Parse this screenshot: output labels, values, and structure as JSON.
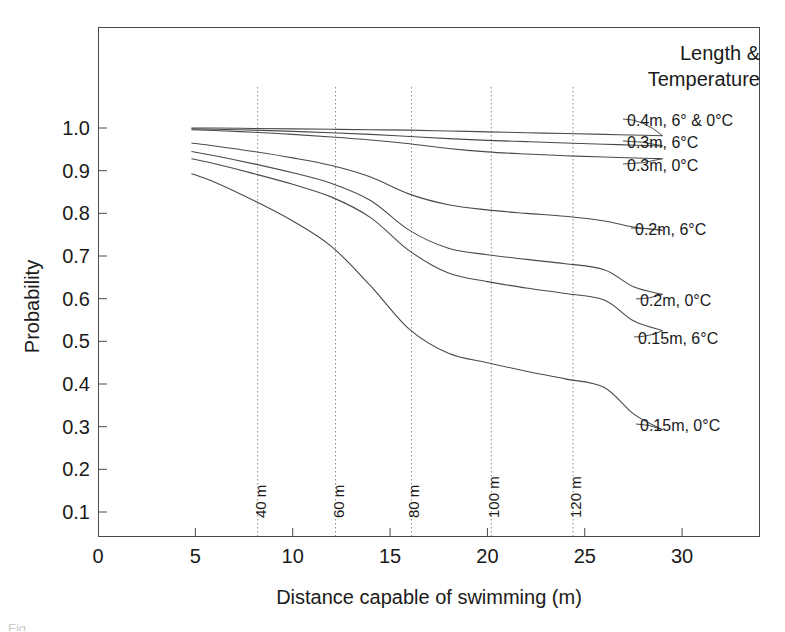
{
  "chart_data": {
    "type": "line",
    "title": "",
    "xlabel": "Distance capable of swimming (m)",
    "ylabel": "Probability",
    "xlim": [
      0,
      34
    ],
    "ylim": [
      0.0,
      1.05
    ],
    "grid": false,
    "legend_position": "right-inline-labels",
    "legend_title_line1": "Length &",
    "legend_title_line2": "Temperature",
    "xticks": [
      "0",
      "5",
      "10",
      "15",
      "20",
      "25",
      "30"
    ],
    "xtick_values": [
      0,
      5,
      10,
      15,
      20,
      25,
      30
    ],
    "yticks": [
      "1.0",
      "0.9",
      "0.8",
      "0.7",
      "0.6",
      "0.5",
      "0.4",
      "0.3",
      "0.2",
      "0.1"
    ],
    "ytick_values": [
      1.0,
      0.9,
      0.8,
      0.7,
      0.6,
      0.5,
      0.4,
      0.3,
      0.2,
      0.1
    ],
    "vertical_markers": [
      {
        "label": "40 m",
        "x": 8.2
      },
      {
        "label": "60 m",
        "x": 12.2
      },
      {
        "label": "80 m",
        "x": 16.1
      },
      {
        "label": "100 m",
        "x": 20.2
      },
      {
        "label": "120 m",
        "x": 24.4
      }
    ],
    "series": [
      {
        "name": "0.4m, 6° & 0°C",
        "label": "0.4m, 6° & 0°C",
        "x": [
          4.8,
          6,
          8,
          10,
          12,
          14,
          16,
          18,
          20,
          22,
          24,
          26,
          28,
          29
        ],
        "y": [
          1.0,
          1.0,
          0.999,
          0.998,
          0.997,
          0.996,
          0.995,
          0.993,
          0.991,
          0.989,
          0.987,
          0.985,
          0.983,
          0.982
        ]
      },
      {
        "name": "0.3m, 6°C",
        "label": "0.3m, 6°C",
        "x": [
          4.8,
          6,
          8,
          10,
          12,
          14,
          16,
          18,
          20,
          22,
          24,
          26,
          28,
          29
        ],
        "y": [
          0.998,
          0.997,
          0.995,
          0.992,
          0.989,
          0.985,
          0.98,
          0.975,
          0.971,
          0.968,
          0.965,
          0.962,
          0.959,
          0.958
        ]
      },
      {
        "name": "0.3m, 0°C",
        "label": "0.3m, 0°C",
        "x": [
          4.8,
          6,
          8,
          10,
          12,
          14,
          16,
          18,
          20,
          22,
          24,
          26,
          28,
          29
        ],
        "y": [
          0.996,
          0.994,
          0.99,
          0.985,
          0.979,
          0.972,
          0.963,
          0.952,
          0.944,
          0.939,
          0.935,
          0.932,
          0.929,
          0.928
        ]
      },
      {
        "name": "0.2m, 6°C",
        "label": "0.2m, 6°C",
        "x": [
          4.8,
          6,
          8,
          10,
          12,
          14,
          16,
          18,
          20,
          22,
          24,
          26,
          27.5,
          29
        ],
        "y": [
          0.965,
          0.958,
          0.945,
          0.93,
          0.912,
          0.885,
          0.845,
          0.82,
          0.808,
          0.8,
          0.793,
          0.782,
          0.768,
          0.76
        ]
      },
      {
        "name": "0.2m, 0°C",
        "label": "0.2m, 0°C",
        "x": [
          4.8,
          6,
          8,
          10,
          12,
          14,
          16,
          18,
          20,
          22,
          24,
          26,
          27.5,
          29
        ],
        "y": [
          0.945,
          0.935,
          0.916,
          0.895,
          0.87,
          0.83,
          0.76,
          0.718,
          0.703,
          0.692,
          0.682,
          0.668,
          0.628,
          0.61
        ]
      },
      {
        "name": "0.15m, 6°C",
        "label": "0.15m, 6°C",
        "x": [
          4.8,
          6,
          8,
          10,
          12,
          14,
          16,
          18,
          20,
          22,
          24,
          26,
          27.5,
          29
        ],
        "y": [
          0.928,
          0.916,
          0.893,
          0.868,
          0.838,
          0.79,
          0.712,
          0.66,
          0.64,
          0.625,
          0.612,
          0.597,
          0.548,
          0.525
        ]
      },
      {
        "name": "0.15m, 0°C",
        "label": "0.15m, 0°C",
        "x": [
          4.8,
          6,
          8,
          10,
          12,
          14,
          16,
          18,
          20,
          22,
          24,
          26,
          27.5,
          29
        ],
        "y": [
          0.893,
          0.873,
          0.83,
          0.782,
          0.722,
          0.63,
          0.528,
          0.472,
          0.45,
          0.43,
          0.412,
          0.392,
          0.33,
          0.293
        ]
      }
    ],
    "series_label_positions": [
      {
        "label": "0.4m, 6° & 0°C",
        "px": 627,
        "py": 113
      },
      {
        "label": "0.3m, 6°C",
        "px": 627,
        "py": 135
      },
      {
        "label": "0.3m, 0°C",
        "px": 627,
        "py": 158
      },
      {
        "label": "0.2m, 6°C",
        "px": 635,
        "py": 222
      },
      {
        "label": "0.2m, 0°C",
        "px": 640,
        "py": 293
      },
      {
        "label": "0.15m, 6°C",
        "px": 638,
        "py": 331
      },
      {
        "label": "0.15m, 0°C",
        "px": 640,
        "py": 418
      }
    ],
    "colors": {
      "line": "#4a4a4a",
      "frame": "#4a4a4a",
      "marker_line": "#8a8a8a",
      "text": "#1a1a1a",
      "background": "#ffffff"
    }
  },
  "caption": {
    "clipped_text": "Fig."
  }
}
